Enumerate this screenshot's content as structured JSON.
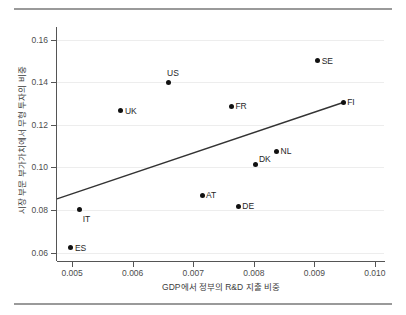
{
  "chart_data": {
    "type": "scatter",
    "title": "",
    "xlabel": "GDP에서 정부의 R&D 지출 비중",
    "ylabel": "시장 부문 부가가치에서 무형 투자의 비중",
    "xlim": [
      0.00475,
      0.01015
    ],
    "ylim": [
      0.0565,
      0.1655
    ],
    "grid": true,
    "legend": false,
    "xticks": [
      "0.005",
      "0.006",
      "0.007",
      "0.008",
      "0.009",
      "0.010"
    ],
    "xtick_values": [
      0.005,
      0.006,
      0.007,
      0.008,
      0.009,
      0.01
    ],
    "yticks": [
      "0.06",
      "0.08",
      "0.10",
      "0.12",
      "0.14",
      "0.16"
    ],
    "ytick_values": [
      0.06,
      0.08,
      0.1,
      0.12,
      0.14,
      0.16
    ],
    "point_color": "#111111",
    "trendline_color": "#333333",
    "points": [
      {
        "label": "ES",
        "x": 0.00498,
        "y": 0.0622,
        "label_pos": "right"
      },
      {
        "label": "IT",
        "x": 0.005125,
        "y": 0.08,
        "label_pos": "below-right"
      },
      {
        "label": "UK",
        "x": 0.005805,
        "y": 0.1266,
        "label_pos": "right"
      },
      {
        "label": "US",
        "x": 0.006585,
        "y": 0.14,
        "label_pos": "above"
      },
      {
        "label": "AT",
        "x": 0.007145,
        "y": 0.087,
        "label_pos": "right"
      },
      {
        "label": "FR",
        "x": 0.00763,
        "y": 0.1288,
        "label_pos": "right"
      },
      {
        "label": "DE",
        "x": 0.007745,
        "y": 0.0817,
        "label_pos": "right"
      },
      {
        "label": "DK",
        "x": 0.008035,
        "y": 0.1012,
        "label_pos": "above-right"
      },
      {
        "label": "NL",
        "x": 0.008375,
        "y": 0.1075,
        "label_pos": "right"
      },
      {
        "label": "SE",
        "x": 0.009055,
        "y": 0.15,
        "label_pos": "right"
      },
      {
        "label": "FI",
        "x": 0.009475,
        "y": 0.1305,
        "label_pos": "right"
      }
    ],
    "trendline": {
      "x_start": 0.00475,
      "y_start": 0.0852,
      "x_end": 0.009475,
      "y_end": 0.1305
    }
  }
}
